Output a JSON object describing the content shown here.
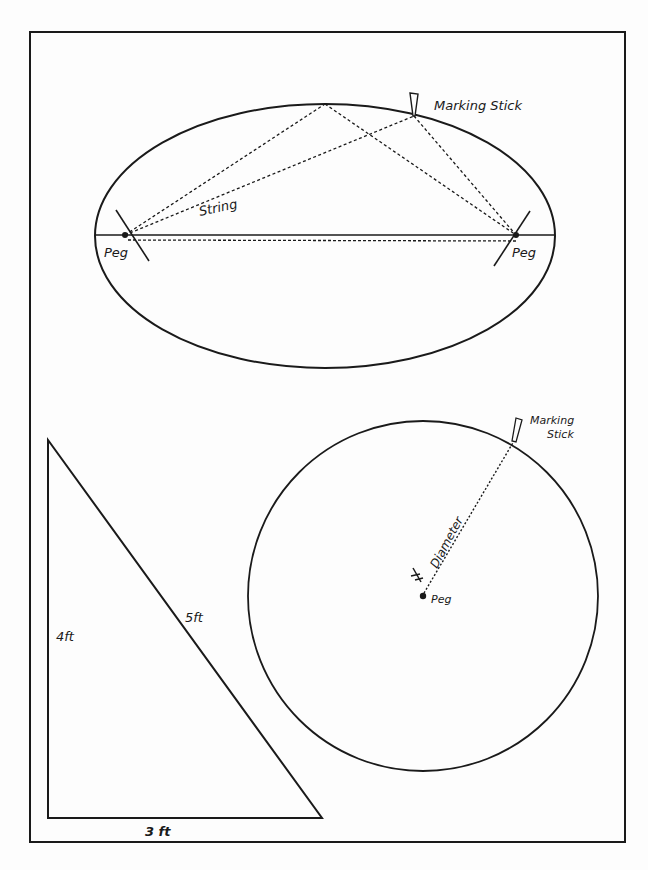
{
  "figure": {
    "ellipse_panel": {
      "labels": {
        "marking_stick": "Marking Stick",
        "string": "String",
        "peg_left": "Peg",
        "peg_right": "Peg"
      }
    },
    "circle_panel": {
      "labels": {
        "marking_stick_line1": "Marking",
        "marking_stick_line2": "Stick",
        "diameter": "Diameter",
        "peg": "Peg"
      }
    },
    "triangle_panel": {
      "labels": {
        "vertical_side": "4ft",
        "hypotenuse": "5ft",
        "base": "3 ft"
      }
    }
  },
  "colors": {
    "ink": "#1a1a1a",
    "paper": "#fdfdfd"
  }
}
